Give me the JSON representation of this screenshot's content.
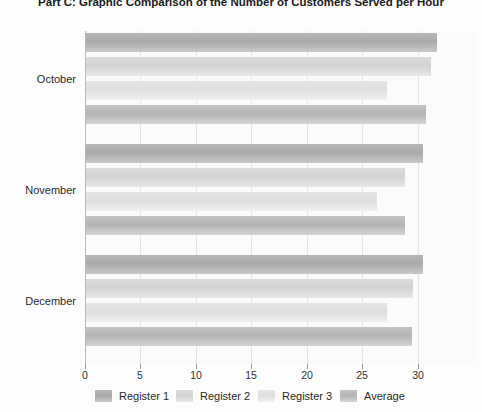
{
  "chart_data": {
    "type": "bar",
    "orientation": "horizontal",
    "title": "Part C: Graphic Comparison of the Number of Customers Served per Hour",
    "xlabel": "",
    "ylabel": "",
    "categories": [
      "October",
      "November",
      "December"
    ],
    "series": [
      {
        "name": "Register 1",
        "color": "#aeaeae",
        "values": [
          31.6,
          30.4,
          30.4
        ]
      },
      {
        "name": "Register 2",
        "color": "#d6d6d6",
        "values": [
          31.1,
          28.7,
          29.5
        ]
      },
      {
        "name": "Register 3",
        "color": "#e2e2e2",
        "values": [
          27.1,
          26.2,
          27.1
        ]
      },
      {
        "name": "Average",
        "color": "#bababa",
        "values": [
          30.6,
          28.7,
          29.4
        ]
      }
    ],
    "xticks": [
      0,
      5,
      10,
      15,
      20,
      25,
      30
    ],
    "xtick_labels": [
      "0",
      "5",
      "10",
      "15",
      "20",
      "25",
      "30"
    ],
    "xlim": [
      0,
      35
    ],
    "grid": true,
    "legend_position": "bottom"
  },
  "legend": {
    "items": [
      {
        "label": "Register 1"
      },
      {
        "label": "Register 2"
      },
      {
        "label": "Register 3"
      },
      {
        "label": "Average"
      }
    ]
  }
}
